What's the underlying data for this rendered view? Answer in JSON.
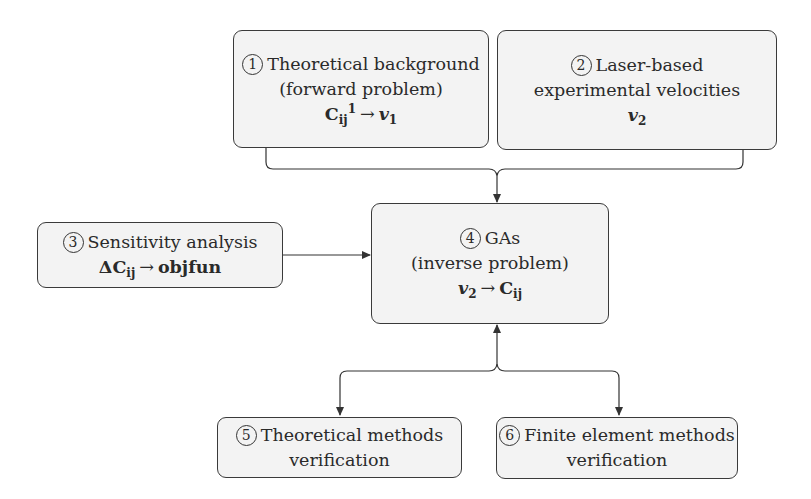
{
  "diagram": {
    "type": "flowchart",
    "nodes": [
      {
        "id": 1,
        "number": "1",
        "lines": [
          "Theoretical background",
          "(forward problem)"
        ],
        "formula": {
          "left": "C",
          "left_sub": "ij",
          "left_sup": "1",
          "arrow": "→",
          "right": "v",
          "right_sub": "1"
        }
      },
      {
        "id": 2,
        "number": "2",
        "lines": [
          "Laser-based",
          "experimental velocities"
        ],
        "formula": {
          "right": "v",
          "right_sub": "2"
        }
      },
      {
        "id": 3,
        "number": "3",
        "lines": [
          "Sensitivity analysis"
        ],
        "formula": {
          "prefix": "Δ",
          "left": "C",
          "left_sub": "ij",
          "arrow": "→",
          "right": "objfun"
        }
      },
      {
        "id": 4,
        "number": "4",
        "lines": [
          "GAs",
          "(inverse problem)"
        ],
        "formula": {
          "left": "v",
          "left_sub": "2",
          "arrow": "→",
          "right": "C",
          "right_sub": "ij"
        }
      },
      {
        "id": 5,
        "number": "5",
        "lines": [
          "Theoretical methods",
          "verification"
        ]
      },
      {
        "id": 6,
        "number": "6",
        "lines": [
          "Finite element methods",
          "verification"
        ]
      }
    ],
    "edges": [
      {
        "from": [
          1,
          2
        ],
        "to": 4,
        "style": "merge-bracket"
      },
      {
        "from": 3,
        "to": 4,
        "style": "arrow"
      },
      {
        "from": 4,
        "to": 5,
        "style": "bidirectional-branch"
      },
      {
        "from": 4,
        "to": 6,
        "style": "bidirectional-branch"
      }
    ],
    "colors": {
      "box_fill": "#f3f3f3",
      "stroke": "#3a3a3a",
      "background": "#ffffff"
    }
  }
}
